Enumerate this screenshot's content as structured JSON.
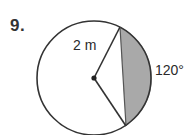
{
  "problem": {
    "number": "9.",
    "radius_label": "2 m",
    "angle_label": "120°"
  },
  "figure": {
    "shape": "circle",
    "center": [
      94,
      78
    ],
    "radius_px": 57,
    "chord_start": [
      120,
      27
    ],
    "chord_end": [
      126,
      126
    ],
    "shaded_region": "segment",
    "colors": {
      "stroke": "#333333",
      "shade": "#a9a9a9",
      "background": "#ffffff"
    }
  }
}
